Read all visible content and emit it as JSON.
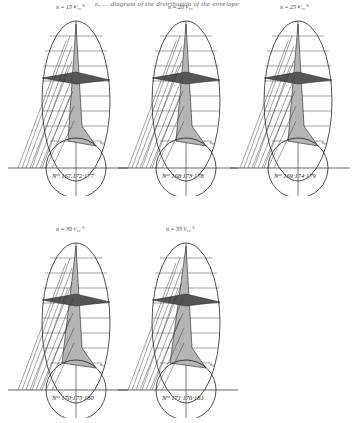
{
  "page": {
    "header_fragment": "n, ... diagram of the distribution of the envelope"
  },
  "figures": [
    {
      "id": "fig1",
      "top_label": "n = 15 ⁴⁄₁₀ °",
      "numbers_label": "Nᵒˢ 167.172·177",
      "x": 8,
      "y": 6
    },
    {
      "id": "fig2",
      "top_label": "n = 20 ¹⁄₁₀",
      "numbers_label": "Nᵒˢ 168·173·178",
      "x": 118,
      "y": 6
    },
    {
      "id": "fig3",
      "top_label": "n = 25 ⁴⁄₁₀ °",
      "numbers_label": "Nᵒˢ 169·174·179",
      "x": 230,
      "y": 6
    },
    {
      "id": "fig4",
      "top_label": "n = 30 ¹⁄₁₀ °",
      "numbers_label": "Nᵒˢ 170·175·180",
      "x": 8,
      "y": 228
    },
    {
      "id": "fig5",
      "top_label": "n = 35 ¹⁄₁₀ °",
      "numbers_label": "Nᵒˢ 171·176·181",
      "x": 118,
      "y": 228
    }
  ],
  "colors": {
    "ink": "#222222",
    "paper": "#ffffff",
    "hatch": "#333333"
  }
}
